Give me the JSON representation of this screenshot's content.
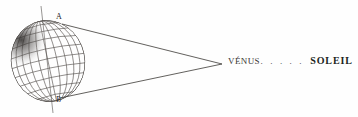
{
  "figure": {
    "type": "astronomical-diagram",
    "background_color": "#fefefe",
    "ink_color": "#3a3734",
    "pole_labels": {
      "north": "A",
      "south": "B"
    },
    "caption": {
      "near_body": "VÉNUS",
      "separator_dots": ". . . . .",
      "far_body": "SOLEIL"
    },
    "globe": {
      "center_x": 48,
      "center_y": 61,
      "radius_x": 37,
      "radius_y": 41,
      "tilt_degrees": -12,
      "meridian_count": 11,
      "parallel_count": 9,
      "shaded_region": "upper-left-limb"
    },
    "axis": {
      "top_x": 41,
      "top_y": 6,
      "bottom_x": 53,
      "bottom_y": 113
    },
    "apex": {
      "x": 222,
      "y": 64
    },
    "tangents": [
      {
        "from_x": 62,
        "from_y": 24,
        "to_x": 222,
        "to_y": 64
      },
      {
        "from_x": 60,
        "from_y": 98,
        "to_x": 222,
        "to_y": 64
      }
    ]
  }
}
